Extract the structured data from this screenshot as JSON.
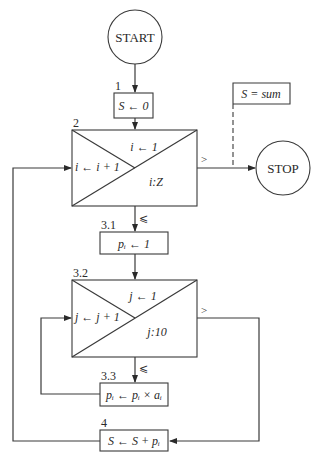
{
  "flowchart": {
    "start": {
      "label": "START"
    },
    "stop": {
      "label": "STOP"
    },
    "steps": [
      {
        "id": "1",
        "label": "S ← 0"
      },
      {
        "id": "2",
        "init": "i ← 1",
        "increment": "i ← i + 1",
        "test": "i:Z",
        "exit_condition": ">",
        "continue_condition": "⩽"
      },
      {
        "id": "3.1",
        "label": "pᵢ ← 1"
      },
      {
        "id": "3.2",
        "init": "j ← 1",
        "increment": "j ← j + 1",
        "test": "j:10",
        "exit_condition": ">",
        "continue_condition": "⩽"
      },
      {
        "id": "3.3",
        "label": "pᵢ ← pᵢ × aᵢ"
      },
      {
        "id": "4",
        "label": "S ← S + pᵢ"
      }
    ],
    "annotation": {
      "label": "S = sum"
    }
  }
}
